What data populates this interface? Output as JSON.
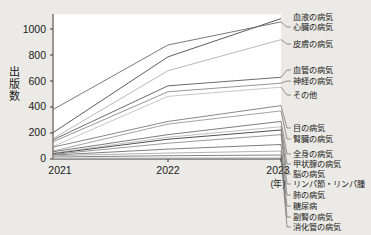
{
  "chart_data": {
    "type": "line",
    "title": "",
    "xlabel": "年",
    "ylabel": "出版数",
    "x": [
      "2021",
      "2022",
      "2023"
    ],
    "categories": [
      "2021",
      "2022",
      "2023"
    ],
    "ylim": [
      0,
      1100
    ],
    "yticks": [
      0,
      200,
      400,
      600,
      800,
      1000
    ],
    "grid": false,
    "legend_position": "right-inline-labels",
    "series": [
      {
        "name": "血液の病気",
        "values": [
          200,
          775,
          1065
        ],
        "color": "#4a4a4a"
      },
      {
        "name": "心臓の病気",
        "values": [
          375,
          865,
          1040
        ],
        "color": "#6a6a6a"
      },
      {
        "name": "皮膚の病気",
        "values": [
          155,
          670,
          905
        ],
        "color": "#b0b0b0"
      },
      {
        "name": "血管の病気",
        "values": [
          145,
          555,
          620
        ],
        "color": "#5a5a5a"
      },
      {
        "name": "神経の病気",
        "values": [
          130,
          510,
          575
        ],
        "color": "#8a8a8a"
      },
      {
        "name": "その他",
        "values": [
          95,
          475,
          545
        ],
        "color": "#c0c0c0"
      },
      {
        "name": "目の病気",
        "values": [
          90,
          285,
          405
        ],
        "color": "#7a7a7a"
      },
      {
        "name": "腎臓の病気",
        "values": [
          60,
          265,
          365
        ],
        "color": "#9a9a9a"
      },
      {
        "name": "全身の病気",
        "values": [
          55,
          185,
          285
        ],
        "color": "#6e6e6e"
      },
      {
        "name": "甲状腺の病気",
        "values": [
          45,
          165,
          245
        ],
        "color": "#b8b8b8"
      },
      {
        "name": "脳の病気",
        "values": [
          40,
          150,
          220
        ],
        "color": "#3c3c3c"
      },
      {
        "name": "リンパ節・リンパ腫",
        "values": [
          35,
          120,
          185
        ],
        "color": "#8f8f8f"
      },
      {
        "name": "肺の病気",
        "values": [
          30,
          75,
          110
        ],
        "color": "#707070"
      },
      {
        "name": "糖尿病",
        "values": [
          25,
          45,
          60
        ],
        "color": "#a8a8a8"
      },
      {
        "name": "副腎の病気",
        "values": [
          15,
          25,
          30
        ],
        "color": "#787878"
      },
      {
        "name": "消化管の病気",
        "values": [
          8,
          10,
          12
        ],
        "color": "#cfcfcf"
      }
    ]
  },
  "axes": {
    "y_title": "出版数",
    "y_ticks": [
      "1000",
      "800",
      "600",
      "400",
      "200",
      "0"
    ],
    "x_ticks": [
      "2021",
      "2022",
      "2023"
    ],
    "x_unit": "(年)"
  },
  "labels": {
    "s0": "血液の病気",
    "s1": "心臓の病気",
    "s2": "皮膚の病気",
    "s3": "血管の病気",
    "s4": "神経の病気",
    "s5": "その他",
    "s6": "目の病気",
    "s7": "腎臓の病気",
    "s8": "全身の病気",
    "s9": "甲状腺の病気",
    "s10": "脳の病気",
    "s11": "リンパ節・リンパ腫",
    "s12": "肺の病気",
    "s13": "糖尿病",
    "s14": "副腎の病気",
    "s15": "消化管の病気"
  }
}
